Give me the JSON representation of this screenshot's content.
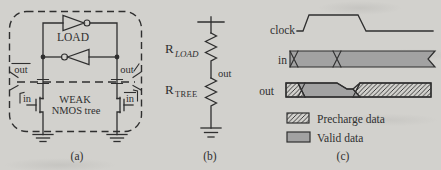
{
  "colors": {
    "background": "#d2d1cd",
    "ink": "#2f2f2f",
    "valid_gray": "#a2a2a2"
  },
  "panel_a": {
    "load_label": "LOAD",
    "out_left": "out",
    "out_right": "out",
    "in_left": "in",
    "in_right": "in",
    "tree_line1": "WEAK",
    "tree_line2": "NMOS tree",
    "caption": "(a)"
  },
  "panel_b": {
    "r_load_base": "R",
    "r_load_sub": "LOAD",
    "out_label": "out",
    "r_tree_base": "R",
    "r_tree_sub": "TREE",
    "caption": "(b)"
  },
  "panel_c": {
    "clock_label": "clock",
    "in_label": "in",
    "out_label": "out",
    "legend": [
      {
        "swatch": "precharge-hatch",
        "label": "Precharge data"
      },
      {
        "swatch": "valid-gray",
        "label": "Valid data"
      }
    ],
    "caption": "(c)"
  }
}
